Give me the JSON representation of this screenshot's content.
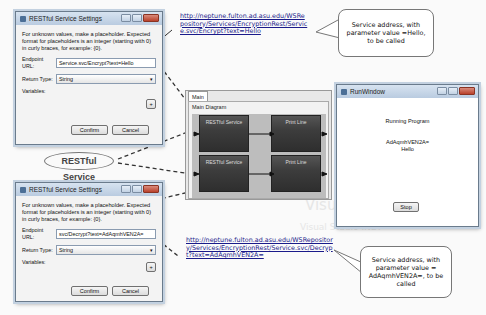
{
  "top_dialog": {
    "title": "RESTful Service Settings",
    "instructions": "For unknown values, make a placeholder. Expected format for placeholders is an integer (starting with 0) in curly braces, for example: {0}.",
    "endpoint_label": "Endpoint URL:",
    "endpoint_value": "Service.svc/Encrypt?text=Hello",
    "return_type_label": "Return Type:",
    "return_type_value": "String",
    "variables_label": "Variables:",
    "add_label": "+",
    "confirm_label": "Confirm",
    "cancel_label": "Cancel"
  },
  "bottom_dialog": {
    "title": "RESTful Service Settings",
    "instructions": "For unknown values, make a placeholder. Expected format for placeholders is an integer (starting with 0) in curly braces, for example: {0}.",
    "endpoint_label": "Endpoint URL:",
    "endpoint_value": "svc/Decrypt?text=AdAqmhVEN2A=",
    "return_type_label": "Return Type:",
    "return_type_value": "String",
    "variables_label": "Variables:",
    "add_label": "+",
    "confirm_label": "Confirm",
    "cancel_label": "Cancel"
  },
  "top_url": "http://neptune.fulton.ad.asu.edu/WSRepository/Services/EncryptionRest/Service.svc/Encrypt?text=Hello",
  "top_callout": "Service address, with parameter value =Hello, to be called",
  "bottom_url": "http://neptune.fulton.ad.asu.edu/WSRepository/Services/EncryptionRest/Service.svc/Decrypt?text=AdAqmhVEN2A=",
  "bottom_callout": "Service address, with parameter value = AdAqmhVEN2A=, to be called",
  "restful_label": "RESTful Service",
  "diagram": {
    "tab": "Main",
    "title": "Main Diagram",
    "blocks": [
      {
        "label": "RESTful Service"
      },
      {
        "label": "Print Line"
      },
      {
        "label": "RESTful Service"
      },
      {
        "label": "Print Line"
      }
    ]
  },
  "run_window": {
    "title": "RunWindow",
    "status": "Running Program",
    "output_line1": "AdAqmhVEN2A=",
    "output_line2": "Hello",
    "stop_label": "Stop"
  },
  "background_text": {
    "line1": "Visual Studio",
    "line2": "Visual Studio .NET"
  }
}
